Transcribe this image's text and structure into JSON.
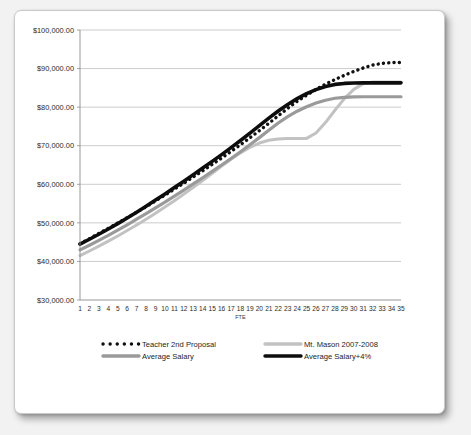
{
  "chart_data": {
    "type": "line",
    "title": "",
    "xlabel": "FTE",
    "ylabel": "",
    "xlim": [
      1,
      35
    ],
    "ylim": [
      30000,
      100000
    ],
    "ytick_step": 10000,
    "grid": true,
    "legend_position": "bottom",
    "ytick_labels": [
      "$100,000.00",
      "$90,000.00",
      "$80,000.00",
      "$70,000.00",
      "$60,000.00",
      "$50,000.00",
      "$40,000.00",
      "$30,000.00"
    ],
    "ytick_values": [
      100000,
      90000,
      80000,
      70000,
      60000,
      50000,
      40000,
      30000
    ],
    "categories": [
      "1",
      "2",
      "3",
      "4",
      "5",
      "6",
      "7",
      "8",
      "9",
      "10",
      "11",
      "12",
      "13",
      "14",
      "15",
      "16",
      "17",
      "18",
      "19",
      "20",
      "21",
      "22",
      "23",
      "24",
      "25",
      "26",
      "27",
      "28",
      "29",
      "30",
      "31",
      "32",
      "33",
      "34",
      "35"
    ],
    "series": [
      {
        "name": "Teacher 2nd Proposal",
        "color": "#111111",
        "style": "dotted",
        "width": 2.6,
        "values": [
          44600,
          45900,
          47250,
          48600,
          49950,
          51350,
          52750,
          54200,
          55700,
          57200,
          58750,
          60300,
          61900,
          63500,
          65150,
          66800,
          68500,
          70250,
          72050,
          73900,
          75800,
          77750,
          79700,
          81500,
          83100,
          84600,
          85950,
          87150,
          88250,
          89250,
          90150,
          90900,
          91350,
          91550,
          91600
        ]
      },
      {
        "name": "Mt. Mason 2007-2008",
        "color": "#c2c2c2",
        "style": "solid",
        "width": 3.0,
        "values": [
          41500,
          42700,
          43950,
          45250,
          46600,
          48000,
          49450,
          50950,
          52500,
          54100,
          55750,
          57450,
          59200,
          61000,
          62850,
          64700,
          66500,
          68150,
          69600,
          70700,
          71400,
          71750,
          71850,
          71850,
          71900,
          73300,
          76000,
          79200,
          82200,
          84600,
          86100,
          86500,
          86550,
          86550,
          86550
        ]
      },
      {
        "name": "Average Salary",
        "color": "#9a9a9a",
        "style": "solid",
        "width": 3.2,
        "values": [
          43000,
          44200,
          45450,
          46750,
          48100,
          49500,
          50950,
          52400,
          53900,
          55400,
          56950,
          58500,
          60100,
          61700,
          63350,
          65000,
          66700,
          68450,
          70250,
          72100,
          74000,
          75900,
          77550,
          78950,
          80100,
          81050,
          81800,
          82300,
          82550,
          82650,
          82700,
          82700,
          82700,
          82700,
          82700
        ]
      },
      {
        "name": "Average Salary+4%",
        "color": "#0d0d0d",
        "style": "solid",
        "width": 3.6,
        "values": [
          44500,
          45750,
          47050,
          48400,
          49800,
          51250,
          52750,
          54300,
          55900,
          57500,
          59150,
          60800,
          62500,
          64200,
          65950,
          67700,
          69500,
          71350,
          73250,
          75200,
          77150,
          79000,
          80700,
          82200,
          83500,
          84550,
          85350,
          85900,
          86150,
          86250,
          86300,
          86300,
          86300,
          86300,
          86300
        ]
      }
    ],
    "legend": [
      {
        "label": "Teacher 2nd Proposal",
        "color": "#111111",
        "style": "dotted"
      },
      {
        "label": "Mt. Mason 2007-2008",
        "color": "#c2c2c2",
        "style": "solid"
      },
      {
        "label": "Average Salary",
        "color": "#9a9a9a",
        "style": "solid"
      },
      {
        "label": "Average Salary+4%",
        "color": "#0d0d0d",
        "style": "solid"
      }
    ]
  }
}
